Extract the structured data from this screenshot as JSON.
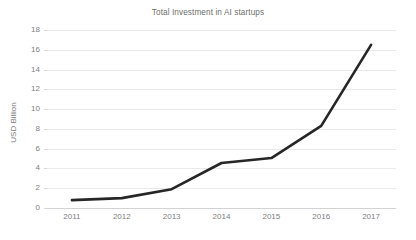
{
  "chart_data": {
    "type": "line",
    "title": "Total Investment in AI startups",
    "xlabel": "",
    "ylabel": "USD Billion",
    "categories": [
      "2011",
      "2012",
      "2013",
      "2014",
      "2015",
      "2016",
      "2017"
    ],
    "values": [
      0.8,
      1.0,
      1.9,
      4.55,
      5.05,
      8.3,
      16.5
    ],
    "series": [
      {
        "name": "Total Investment",
        "values": [
          0.8,
          1.0,
          1.9,
          4.55,
          5.05,
          8.3,
          16.5
        ]
      }
    ],
    "ylim": [
      0,
      18
    ],
    "ytick_labels": [
      "18",
      "16",
      "14",
      "12",
      "10",
      "8",
      "6",
      "4",
      "2",
      "0"
    ],
    "ytick_values": [
      18,
      16,
      14,
      12,
      10,
      8,
      6,
      4,
      2,
      0
    ],
    "grid": true,
    "grid_axis": "y",
    "legend": false,
    "legend_position": "none",
    "line_color": "#262626",
    "grid_color": "#e9e9e9",
    "text_color": "#808080",
    "background_color": "#ffffff",
    "annotations": []
  }
}
